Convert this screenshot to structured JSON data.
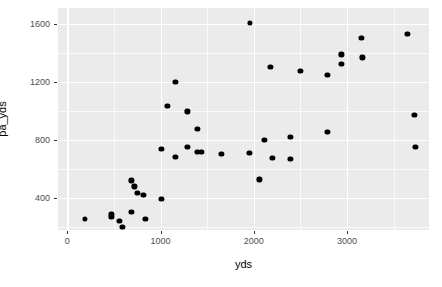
{
  "chart_data": {
    "type": "scatter",
    "title": "",
    "xlabel": "yds",
    "ylabel": "pa_yds",
    "xlim": [
      -100,
      3880
    ],
    "ylim": [
      180,
      1710
    ],
    "xticks": [
      0,
      1000,
      2000,
      3000
    ],
    "xtick_labels": [
      "0",
      "1000",
      "2000",
      "3000"
    ],
    "yticks": [
      400,
      800,
      1200,
      1600
    ],
    "ytick_labels": [
      "400",
      "800",
      "1200",
      "1600"
    ],
    "x_minor_ticks": [
      500,
      1500,
      2500,
      3500
    ],
    "y_minor_ticks": [
      200,
      600,
      1000,
      1400
    ],
    "grid": true,
    "legend": false,
    "panel_background": "#ebebeb",
    "grid_color": "#ffffff",
    "point_color": "#000000",
    "points": [
      {
        "x": 193,
        "y": 254
      },
      {
        "x": 472,
        "y": 268
      },
      {
        "x": 558,
        "y": 241
      },
      {
        "x": 590,
        "y": 200
      },
      {
        "x": 687,
        "y": 302
      },
      {
        "x": 472,
        "y": 288
      },
      {
        "x": 719,
        "y": 481
      },
      {
        "x": 687,
        "y": 522
      },
      {
        "x": 751,
        "y": 434
      },
      {
        "x": 816,
        "y": 424
      },
      {
        "x": 1009,
        "y": 393
      },
      {
        "x": 837,
        "y": 258
      },
      {
        "x": 1159,
        "y": 685
      },
      {
        "x": 1288,
        "y": 752
      },
      {
        "x": 1009,
        "y": 739
      },
      {
        "x": 1395,
        "y": 719
      },
      {
        "x": 1073,
        "y": 1037
      },
      {
        "x": 1159,
        "y": 1200
      },
      {
        "x": 1288,
        "y": 997
      },
      {
        "x": 1395,
        "y": 875
      },
      {
        "x": 1438,
        "y": 719
      },
      {
        "x": 1653,
        "y": 705
      },
      {
        "x": 1953,
        "y": 712
      },
      {
        "x": 1960,
        "y": 1610
      },
      {
        "x": 2060,
        "y": 529
      },
      {
        "x": 2114,
        "y": 800
      },
      {
        "x": 2178,
        "y": 1302
      },
      {
        "x": 2200,
        "y": 678
      },
      {
        "x": 2393,
        "y": 671
      },
      {
        "x": 2393,
        "y": 820
      },
      {
        "x": 2500,
        "y": 1275
      },
      {
        "x": 2790,
        "y": 1248
      },
      {
        "x": 2790,
        "y": 854
      },
      {
        "x": 2940,
        "y": 1390
      },
      {
        "x": 2940,
        "y": 1322
      },
      {
        "x": 3155,
        "y": 1505
      },
      {
        "x": 3165,
        "y": 1370
      },
      {
        "x": 3648,
        "y": 1532
      },
      {
        "x": 3723,
        "y": 976
      },
      {
        "x": 3734,
        "y": 753
      }
    ]
  }
}
